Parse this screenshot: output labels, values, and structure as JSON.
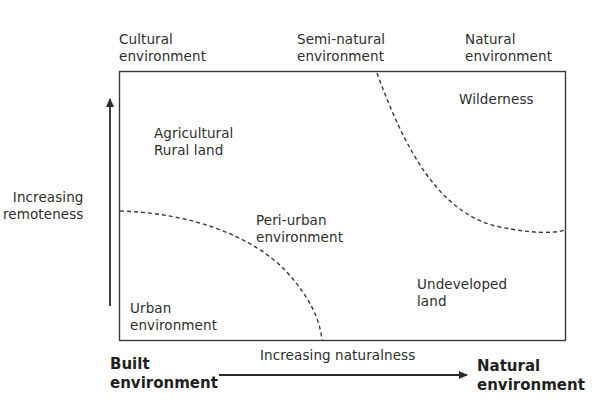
{
  "diagram": {
    "top_labels": {
      "cultural": "Cultural\nenvironment",
      "semi_natural": "Semi-natural\nenvironment",
      "natural": "Natural\nenvironment"
    },
    "regions": {
      "wilderness": "Wilderness",
      "agricultural": "Agricultural\nRural land",
      "peri_urban": "Peri-urban\nenvironment",
      "urban": "Urban\nenvironment",
      "undeveloped": "Undeveloped\nland"
    },
    "axes": {
      "y_label": "Increasing\nremoteness",
      "x_label": "Increasing naturalness",
      "x_start": "Built\nenvironment",
      "x_end": "Natural\nenvironment"
    },
    "colors": {
      "line": "#2b2b2b",
      "text": "#2e2e2e"
    }
  }
}
